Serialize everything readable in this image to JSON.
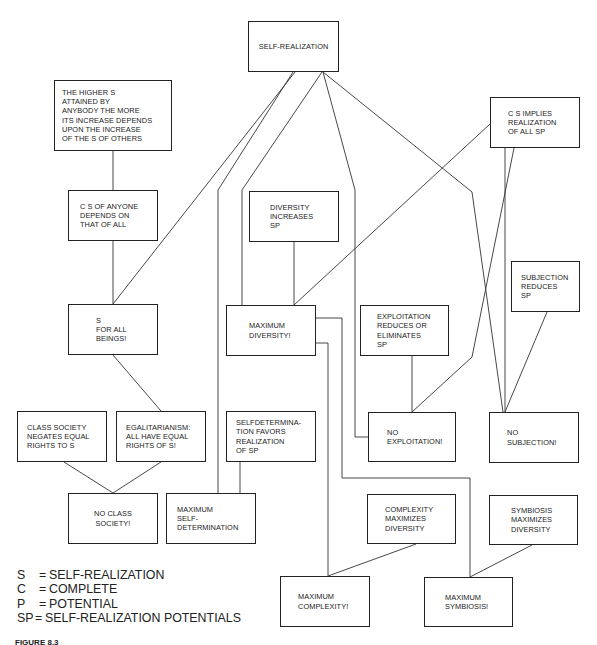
{
  "boxes": {
    "self_realization": "SELF-REALIZATION",
    "higher_s": "THE HIGHER S\nATTAINED BY\nANYBODY THE MORE\nITS INCREASE  DEPENDS\nUPON THE INCREASE\nOF THE S OF OTHERS",
    "cs_of_anyone": "C S OF ANYONE\nDEPENDS ON\nTHAT OF ALL",
    "s_for_all": "S\nFOR ALL\nBEINGS!",
    "cs_implies": "C S IMPLIES\nREALIZATION\nOF ALL SP",
    "diversity_increases": "DIVERSITY\nINCREASES\nSP",
    "maximum_diversity": "MAXIMUM\nDIVERSITY!",
    "exploitation_reduces": "EXPLOITATION\nREDUCES OR\nELIMINATES\nSP",
    "subjection_reduces": "SUBJECTION\nREDUCES\nSP",
    "class_society": "CLASS SOCIETY\nNEGATES EQUAL\nRIGHTS TO S",
    "egalitarianism": "EGALITARIANISM:\nALL HAVE EQUAL\nRIGHTS OF S!",
    "selfdetermination_favors": "SELFDETERMINA-\nTION FAVORS\nREALIZATION\nOF SP",
    "no_exploitation": "NO\nEXPLOITATION!",
    "no_subjection": "NO\nSUBJECTION!",
    "no_class_society": "NO CLASS\nSOCIETY!",
    "maximum_self_determination": "MAXIMUM\nSELF-\nDETERMINATION",
    "complexity_maximizes": "COMPLEXITY\nMAXIMIZES\nDIVERSITY",
    "symbiosis_maximizes": "SYMBIOSIS\nMAXIMIZES\nDIVERSITY",
    "maximum_complexity": "MAXIMUM\nCOMPLEXITY!",
    "maximum_symbiosis": "MAXIMUM\nSYMBIOSIS!"
  },
  "legend": [
    {
      "key": "S",
      "eq": "=",
      "value": "SELF-REALIZATION"
    },
    {
      "key": "C",
      "eq": "=",
      "value": "COMPLETE"
    },
    {
      "key": "P",
      "eq": "=",
      "value": "POTENTIAL"
    },
    {
      "key": "SP",
      "eq": "=",
      "value": "SELF-REALIZATION POTENTIALS"
    }
  ],
  "caption": "FIGURE 8.3",
  "colors": {
    "line": "#333333",
    "border": "#222222",
    "background": "#ffffff"
  }
}
